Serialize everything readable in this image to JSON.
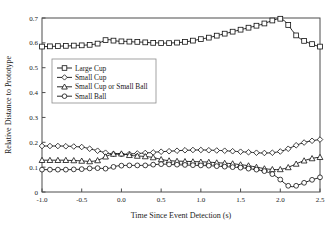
{
  "chart_data": {
    "type": "line",
    "title": "",
    "xlabel": "Time Since Event Detection (s)",
    "ylabel": "Relative Distance to Prototype",
    "xlim": [
      -1.0,
      2.5
    ],
    "ylim": [
      0,
      0.7
    ],
    "xticks": [
      -1.0,
      -0.5,
      0.0,
      0.5,
      1.0,
      1.5,
      2.0,
      2.5
    ],
    "xticklabels": [
      "-1.0",
      "-0.5",
      "0.0",
      "0.5",
      "1.0",
      "1.5",
      "2.0",
      "2.5"
    ],
    "yticks": [
      0,
      0.1,
      0.2,
      0.3,
      0.4,
      0.5,
      0.6,
      0.7
    ],
    "yticklabels": [
      "0",
      "0.1",
      "0.2",
      "0.3",
      "0.4",
      "0.5",
      "0.6",
      "0.7"
    ],
    "grid": false,
    "legend_position": "upper-left-inside",
    "x": [
      -1.0,
      -0.95,
      -0.9,
      -0.85,
      -0.8,
      -0.75,
      -0.7,
      -0.65,
      -0.6,
      -0.55,
      -0.5,
      -0.45,
      -0.4,
      -0.35,
      -0.3,
      -0.25,
      -0.2,
      -0.15,
      -0.1,
      -0.05,
      0.0,
      0.05,
      0.1,
      0.15,
      0.2,
      0.25,
      0.3,
      0.35,
      0.4,
      0.45,
      0.5,
      0.55,
      0.6,
      0.65,
      0.7,
      0.75,
      0.8,
      0.85,
      0.9,
      0.95,
      1.0,
      1.05,
      1.1,
      1.15,
      1.2,
      1.25,
      1.3,
      1.35,
      1.4,
      1.45,
      1.5,
      1.55,
      1.6,
      1.65,
      1.7,
      1.75,
      1.8,
      1.85,
      1.9,
      1.95,
      2.0,
      2.05,
      2.1,
      2.15,
      2.2,
      2.25,
      2.3,
      2.35,
      2.4,
      2.45,
      2.5
    ],
    "series": [
      {
        "name": "Large Cup",
        "marker": "square",
        "values": [
          0.585,
          0.585,
          0.586,
          0.586,
          0.587,
          0.587,
          0.588,
          0.588,
          0.589,
          0.59,
          0.59,
          0.591,
          0.592,
          0.594,
          0.597,
          0.604,
          0.611,
          0.613,
          0.609,
          0.607,
          0.606,
          0.606,
          0.605,
          0.604,
          0.604,
          0.603,
          0.602,
          0.601,
          0.6,
          0.6,
          0.599,
          0.599,
          0.599,
          0.6,
          0.601,
          0.602,
          0.604,
          0.606,
          0.609,
          0.612,
          0.615,
          0.618,
          0.621,
          0.625,
          0.629,
          0.633,
          0.637,
          0.641,
          0.645,
          0.649,
          0.653,
          0.657,
          0.661,
          0.665,
          0.669,
          0.673,
          0.678,
          0.684,
          0.69,
          0.695,
          0.697,
          0.69,
          0.672,
          0.65,
          0.63,
          0.617,
          0.608,
          0.601,
          0.595,
          0.589,
          0.585
        ]
      },
      {
        "name": "Small Cup",
        "marker": "diamond",
        "values": [
          0.185,
          0.185,
          0.185,
          0.185,
          0.185,
          0.185,
          0.184,
          0.184,
          0.183,
          0.182,
          0.181,
          0.178,
          0.174,
          0.17,
          0.166,
          0.162,
          0.158,
          0.155,
          0.153,
          0.152,
          0.152,
          0.152,
          0.153,
          0.154,
          0.155,
          0.156,
          0.157,
          0.158,
          0.159,
          0.161,
          0.162,
          0.163,
          0.164,
          0.165,
          0.166,
          0.167,
          0.168,
          0.168,
          0.169,
          0.169,
          0.169,
          0.169,
          0.168,
          0.168,
          0.167,
          0.167,
          0.166,
          0.165,
          0.164,
          0.163,
          0.162,
          0.161,
          0.16,
          0.159,
          0.158,
          0.157,
          0.157,
          0.157,
          0.158,
          0.16,
          0.163,
          0.168,
          0.174,
          0.181,
          0.188,
          0.194,
          0.199,
          0.203,
          0.206,
          0.209,
          0.211
        ]
      },
      {
        "name": "Small Cup or Small Ball",
        "marker": "triangle",
        "values": [
          0.128,
          0.128,
          0.128,
          0.128,
          0.128,
          0.128,
          0.128,
          0.127,
          0.127,
          0.126,
          0.125,
          0.124,
          0.123,
          0.124,
          0.127,
          0.134,
          0.142,
          0.149,
          0.153,
          0.155,
          0.154,
          0.151,
          0.148,
          0.146,
          0.145,
          0.144,
          0.143,
          0.141,
          0.139,
          0.135,
          0.131,
          0.128,
          0.126,
          0.125,
          0.124,
          0.124,
          0.123,
          0.123,
          0.122,
          0.122,
          0.121,
          0.121,
          0.12,
          0.119,
          0.118,
          0.117,
          0.116,
          0.115,
          0.114,
          0.112,
          0.11,
          0.108,
          0.106,
          0.103,
          0.1,
          0.097,
          0.094,
          0.092,
          0.091,
          0.09,
          0.091,
          0.094,
          0.099,
          0.106,
          0.113,
          0.12,
          0.126,
          0.131,
          0.135,
          0.138,
          0.14
        ]
      },
      {
        "name": "Small Ball",
        "marker": "circle",
        "values": [
          0.09,
          0.09,
          0.09,
          0.09,
          0.09,
          0.09,
          0.09,
          0.09,
          0.091,
          0.091,
          0.092,
          0.093,
          0.095,
          0.096,
          0.096,
          0.095,
          0.094,
          0.096,
          0.101,
          0.105,
          0.106,
          0.107,
          0.107,
          0.107,
          0.107,
          0.107,
          0.107,
          0.108,
          0.11,
          0.111,
          0.112,
          0.112,
          0.111,
          0.11,
          0.11,
          0.109,
          0.109,
          0.108,
          0.108,
          0.107,
          0.107,
          0.106,
          0.106,
          0.105,
          0.104,
          0.103,
          0.102,
          0.101,
          0.1,
          0.099,
          0.098,
          0.096,
          0.094,
          0.092,
          0.09,
          0.087,
          0.084,
          0.079,
          0.072,
          0.062,
          0.05,
          0.036,
          0.025,
          0.021,
          0.025,
          0.031,
          0.037,
          0.043,
          0.049,
          0.054,
          0.059
        ]
      }
    ],
    "legend_entries": [
      {
        "label": "Large Cup",
        "marker": "square"
      },
      {
        "label": "Small Cup",
        "marker": "diamond"
      },
      {
        "label": "Small Cup or Small Ball",
        "marker": "triangle"
      },
      {
        "label": "Small Ball",
        "marker": "circle"
      }
    ],
    "colors": {
      "line": "#111111",
      "marker_fill": "#ffffff",
      "axis": "#4d4d4d",
      "background": "#ffffff"
    }
  }
}
